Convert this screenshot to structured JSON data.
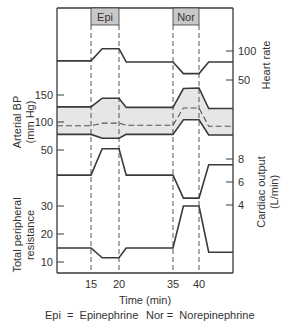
{
  "figure": {
    "drug_labels": [
      {
        "label": "Epi",
        "start_min": 15,
        "end_min": 20
      },
      {
        "label": "Nor",
        "start_min": 35,
        "end_min": 40
      }
    ],
    "x_axis": {
      "title": "Time (min)",
      "ticks": [
        15,
        20,
        35,
        40
      ]
    },
    "legend": {
      "epi": "Epi  =  Epinephrine",
      "nor": "Nor =  Norepinephrine"
    },
    "panels": {
      "heart_rate": {
        "label": "Heart rate",
        "side": "right",
        "ticks": [
          100,
          50
        ]
      },
      "arterial_bp": {
        "label_line1": "Arterial BP",
        "label_line2": "(mm Hg)",
        "side": "left",
        "ticks": [
          150,
          100,
          50
        ]
      },
      "cardiac_output": {
        "label_line1": "Cardiac output",
        "label_line2": "(L/min)",
        "side": "right",
        "ticks": [
          8,
          6,
          4
        ]
      },
      "tpr": {
        "label_line1": "Total peripheral",
        "label_line2": "resistance",
        "side": "left",
        "ticks": [
          30,
          20,
          10
        ]
      }
    },
    "colors": {
      "line": "#3a3a3a",
      "box_fill": "#c8c8c8",
      "band_fill": "#e6e6e6"
    }
  },
  "chart_data": {
    "type": "line",
    "title": "",
    "xlabel": "Time (min)",
    "x_ticks": [
      15,
      20,
      35,
      40
    ],
    "annotations": [
      "Epi (15–20 min)",
      "Nor (35–40 min)",
      "Epi = Epinephrine",
      "Nor = Norepinephrine"
    ],
    "series": [
      {
        "name": "Heart rate",
        "axis": "right",
        "ticks": [
          50,
          100
        ],
        "points": [
          [
            5,
            83
          ],
          [
            15,
            83
          ],
          [
            17,
            104
          ],
          [
            20,
            104
          ],
          [
            22,
            81
          ],
          [
            35,
            81
          ],
          [
            37,
            61
          ],
          [
            40,
            61
          ],
          [
            42,
            81
          ],
          [
            47,
            81
          ]
        ]
      },
      {
        "name": "Arterial BP systolic (mm Hg)",
        "axis": "left",
        "ticks": [
          50,
          100,
          150
        ],
        "points": [
          [
            5,
            128
          ],
          [
            15,
            128
          ],
          [
            17,
            144
          ],
          [
            20,
            144
          ],
          [
            22,
            127
          ],
          [
            35,
            127
          ],
          [
            37,
            162
          ],
          [
            40,
            163
          ],
          [
            42,
            125
          ],
          [
            47,
            125
          ]
        ]
      },
      {
        "name": "Arterial BP mean (mm Hg, dashed)",
        "axis": "left",
        "points": [
          [
            5,
            93
          ],
          [
            15,
            93
          ],
          [
            17,
            98
          ],
          [
            20,
            98
          ],
          [
            22,
            94
          ],
          [
            35,
            94
          ],
          [
            37,
            126
          ],
          [
            40,
            126
          ],
          [
            42,
            92
          ],
          [
            47,
            92
          ]
        ]
      },
      {
        "name": "Arterial BP diastolic (mm Hg)",
        "axis": "left",
        "points": [
          [
            5,
            77
          ],
          [
            15,
            77
          ],
          [
            17,
            70
          ],
          [
            20,
            70
          ],
          [
            22,
            77
          ],
          [
            35,
            77
          ],
          [
            37,
            104
          ],
          [
            40,
            104
          ],
          [
            42,
            76
          ],
          [
            47,
            76
          ]
        ]
      },
      {
        "name": "Cardiac output (L/min)",
        "axis": "right",
        "ticks": [
          4,
          6,
          8
        ],
        "points": [
          [
            5,
            6.6
          ],
          [
            15,
            6.6
          ],
          [
            17,
            8.9
          ],
          [
            20,
            8.9
          ],
          [
            22,
            6.6
          ],
          [
            35,
            6.6
          ],
          [
            37,
            4.6
          ],
          [
            40,
            4.6
          ],
          [
            42,
            7.5
          ],
          [
            47,
            7.5
          ]
        ]
      },
      {
        "name": "Total peripheral resistance",
        "axis": "left",
        "ticks": [
          10,
          20,
          30
        ],
        "points": [
          [
            5,
            15
          ],
          [
            15,
            15
          ],
          [
            17,
            11.5
          ],
          [
            20,
            11.5
          ],
          [
            22,
            15
          ],
          [
            35,
            15
          ],
          [
            37,
            30
          ],
          [
            40,
            30
          ],
          [
            42,
            13.5
          ],
          [
            47,
            13.5
          ]
        ]
      }
    ],
    "grid": false,
    "legend_position": "bottom"
  }
}
